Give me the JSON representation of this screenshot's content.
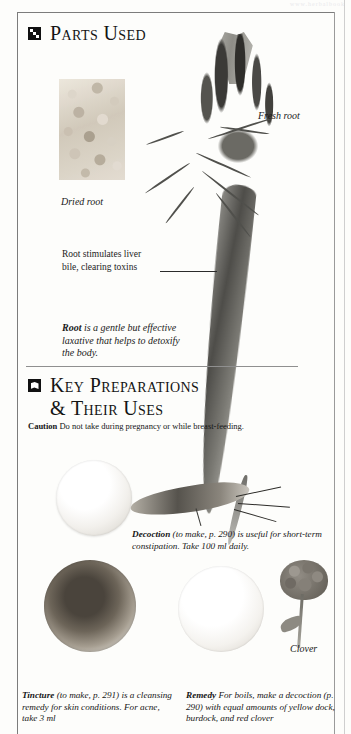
{
  "page": {
    "watermark": "www.herbalbook",
    "accent_color": "#111111",
    "rule_color": "#8f8f8f",
    "paper_color": "#fdfdfb"
  },
  "sections": [
    {
      "id": "parts-used",
      "icon": "parts-grid-icon",
      "title": "Parts Used"
    },
    {
      "id": "key-preparations",
      "icon": "leaf-block-icon",
      "title_line1": "Key Preparations",
      "title_line2": "& Their Uses"
    }
  ],
  "parts_used": {
    "dried_root_label": "Dried root",
    "fresh_root_label": "Fresh root",
    "callout": {
      "line1": "Root stimulates liver",
      "line2": "bile, clearing toxins"
    },
    "description": {
      "lead": "Root",
      "rest": " is a gentle but effective laxative that helps to detoxify the body."
    }
  },
  "key_preparations": {
    "caution": {
      "label": "Caution",
      "text": "Do not take during pregnancy or while breast-feeding."
    },
    "items": [
      {
        "id": "decoction",
        "lead": "Decoction",
        "text": " (to make, p. 290) is useful for short-term constipation. Take 100 ml daily."
      },
      {
        "id": "tincture",
        "lead": "Tincture",
        "text": " (to make, p. 291) is a cleansing remedy for skin conditions. For acne, take 3 ml"
      },
      {
        "id": "remedy",
        "lead": "Remedy",
        "text": " For boils, make a decoction (p. 290) with equal amounts of yellow dock, burdock, and red clover"
      }
    ],
    "clover_label": "Clover"
  }
}
